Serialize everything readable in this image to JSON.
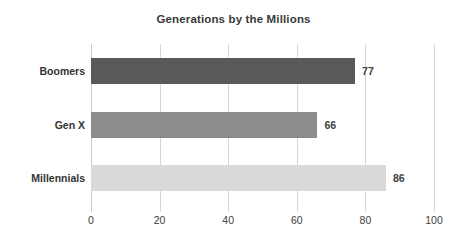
{
  "chart_data": {
    "type": "bar",
    "orientation": "horizontal",
    "title": "Generations by the Millions",
    "xlabel": "",
    "ylabel": "",
    "categories": [
      "Boomers",
      "Gen X",
      "Millennials"
    ],
    "values": [
      77,
      66,
      86
    ],
    "value_labels": [
      "77",
      "66",
      "86"
    ],
    "bar_colors": [
      "#595959",
      "#8c8c8c",
      "#d9d9d9"
    ],
    "xlim": [
      0,
      100
    ],
    "xticks": [
      0,
      20,
      40,
      60,
      80,
      100
    ],
    "xtick_labels": [
      "0",
      "20",
      "40",
      "60",
      "80",
      "100"
    ],
    "grid": "vertical",
    "legend": "none",
    "title_color": "#3a3a3a",
    "gridline_color": "#d6d6d6",
    "background": "#ffffff"
  }
}
